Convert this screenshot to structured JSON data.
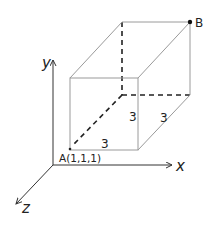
{
  "diagram": {
    "axes": {
      "x_label": "x",
      "y_label": "y",
      "z_label": "z"
    },
    "points": {
      "A_label": "A(1,1,1)",
      "B_label": "B"
    },
    "edge_labels": {
      "front_bottom": "3",
      "front_right": "3",
      "side_bottom": "3"
    }
  }
}
